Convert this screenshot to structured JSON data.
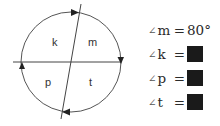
{
  "diagram": {
    "circle": {
      "cx": 71,
      "cy": 62,
      "r": 50,
      "stroke": "#555555"
    },
    "horizontal_line": {
      "x1": 13,
      "y1": 62,
      "x2": 121,
      "y2": 62
    },
    "diagonal_line": {
      "x1": 81,
      "y1": 4,
      "x2": 61,
      "y2": 119
    },
    "regions": [
      {
        "id": "k",
        "label": "k",
        "x": 52,
        "y": 46
      },
      {
        "id": "m",
        "label": "m",
        "x": 89,
        "y": 46
      },
      {
        "id": "p",
        "label": "p",
        "x": 45,
        "y": 86
      },
      {
        "id": "t",
        "label": "t",
        "x": 89,
        "y": 86
      }
    ],
    "arrows": [
      {
        "position": "top",
        "direction": "right"
      },
      {
        "position": "right",
        "direction": "down"
      },
      {
        "position": "bottom",
        "direction": "left"
      },
      {
        "position": "left",
        "direction": "up"
      }
    ]
  },
  "equations": [
    {
      "angle_symbol": "∠",
      "angle": "m",
      "equals": "=",
      "value": "80°",
      "hidden": false
    },
    {
      "angle_symbol": "∠",
      "angle": "k",
      "equals": "=",
      "value": "",
      "hidden": true
    },
    {
      "angle_symbol": "∠",
      "angle": "p",
      "equals": "=",
      "value": "",
      "hidden": true
    },
    {
      "angle_symbol": "∠",
      "angle": "t",
      "equals": "=",
      "value": "",
      "hidden": true
    }
  ],
  "colors": {
    "line": "#555555",
    "text": "#2a2a2a",
    "answer_box": "#1a1a1a"
  }
}
